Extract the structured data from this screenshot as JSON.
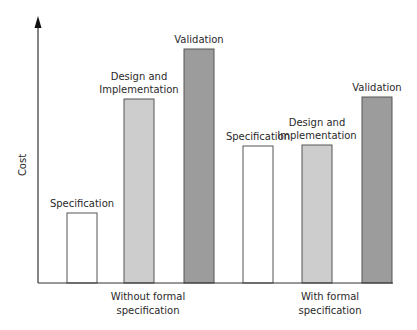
{
  "chart_data": {
    "type": "bar",
    "title": "",
    "xlabel": "",
    "ylabel": "Cost",
    "grid": false,
    "legend": "none",
    "groups": [
      {
        "label": "Without formal specification",
        "label_lines": [
          "Without formal",
          "specification"
        ]
      },
      {
        "label": "With formal specification",
        "label_lines": [
          "With formal",
          "specification"
        ]
      }
    ],
    "categories": [
      "Specification",
      "Design and Implementation",
      "Validation"
    ],
    "series": [
      {
        "name": "Without formal specification",
        "values": [
          70,
          184,
          234
        ]
      },
      {
        "name": "With formal specification",
        "values": [
          137,
          138,
          186
        ]
      }
    ],
    "bars": [
      {
        "group": 0,
        "label": "Specification",
        "label_lines": [
          "Specification"
        ],
        "value": 70,
        "x": 67,
        "fill": "#ffffff"
      },
      {
        "group": 0,
        "label": "Design and Implementation",
        "label_lines": [
          "Design and",
          "Implementation"
        ],
        "value": 184,
        "x": 124,
        "fill": "#cdcdcd"
      },
      {
        "group": 0,
        "label": "Validation",
        "label_lines": [
          "Validation"
        ],
        "value": 234,
        "x": 184,
        "fill": "#9c9c9c"
      },
      {
        "group": 1,
        "label": "Specification",
        "label_lines": [
          "Specification"
        ],
        "value": 137,
        "x": 243,
        "fill": "#ffffff"
      },
      {
        "group": 1,
        "label": "Design and Implementation",
        "label_lines": [
          "Design and",
          "Implementation"
        ],
        "value": 138,
        "x": 302,
        "fill": "#cdcdcd"
      },
      {
        "group": 1,
        "label": "Validation",
        "label_lines": [
          "Validation"
        ],
        "value": 186,
        "x": 362,
        "fill": "#9c9c9c"
      }
    ],
    "value_scale": "relative (no numeric ticks shown)",
    "colors": {
      "specification": "#ffffff",
      "design_implementation": "#cdcdcd",
      "validation": "#9c9c9c",
      "outline": "#555555",
      "axis": "#333333"
    }
  }
}
